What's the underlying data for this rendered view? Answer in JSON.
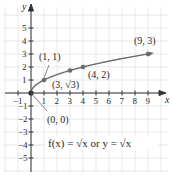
{
  "chart_data": {
    "type": "line",
    "title": "",
    "xlabel": "x",
    "ylabel": "y",
    "xlim": [
      -1,
      10
    ],
    "ylim": [
      -5,
      6
    ],
    "grid": true,
    "x_ticks": [
      -1,
      1,
      2,
      3,
      4,
      5,
      6,
      7,
      8,
      9
    ],
    "y_ticks": [
      -5,
      -4,
      -3,
      -2,
      -1,
      1,
      2,
      3,
      4,
      5
    ],
    "x_tick_labels": [
      "−1",
      "1",
      "2",
      "3",
      "4",
      "5",
      "6",
      "7",
      "8",
      "9"
    ],
    "y_tick_labels": [
      "−5",
      "−4",
      "−3",
      "−2",
      "−1",
      "1",
      "2",
      "3",
      "4",
      "5"
    ],
    "series": [
      {
        "name": "f(x) = √x",
        "function": "sqrt(x)",
        "domain": [
          0,
          9.3
        ],
        "color": "#6b6b6b",
        "marked_points": [
          {
            "x": 0,
            "y": 0,
            "label": "(0, 0)"
          },
          {
            "x": 1,
            "y": 1,
            "label": "(1, 1)"
          },
          {
            "x": 3,
            "y": 1.732,
            "label": "(3, √3)"
          },
          {
            "x": 4,
            "y": 2,
            "label": "(4, 2)"
          },
          {
            "x": 9,
            "y": 3,
            "label": "(9, 3)"
          }
        ]
      }
    ],
    "annotations": [
      {
        "text": "f(x) = √x or y = √x",
        "position": "lower-right quadrant"
      }
    ]
  },
  "labels": {
    "x_axis": "x",
    "y_axis": "y",
    "p00": "(0, 0)",
    "p11": "(1, 1)",
    "p3r3_a": "(3, ",
    "p3r3_b": "√3",
    "p3r3_c": ")",
    "p42": "(4, 2)",
    "p93": "(9, 3)",
    "equation_f": "f(x) = √x or y = √x"
  },
  "colors": {
    "curve": "#6b6b6b",
    "axis": "#333333",
    "grid": "#e3e3e3",
    "point": "#6b6b6b"
  }
}
